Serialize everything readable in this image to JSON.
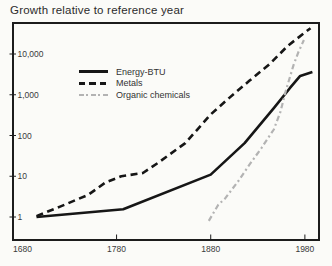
{
  "title": "Growth relative to reference year",
  "chart_data": {
    "type": "line",
    "title": "Growth relative to reference year",
    "xlabel": "",
    "ylabel": "",
    "x_scale": "linear",
    "y_scale": "log",
    "grid": false,
    "legend_position": "upper-left-inside",
    "x_ticks": [
      {
        "year": 1680,
        "label": "1680",
        "mark": false
      },
      {
        "year": 1780,
        "label": "1780",
        "mark": true
      },
      {
        "year": 1880,
        "label": "1880",
        "mark": true
      },
      {
        "year": 1980,
        "label": "1980",
        "mark": true
      }
    ],
    "y_ticks": [
      {
        "value": 1,
        "label": "1"
      },
      {
        "value": 10,
        "label": "10"
      },
      {
        "value": 100,
        "label": "100"
      },
      {
        "value": 1000,
        "label": "1,000"
      },
      {
        "value": 10000,
        "label": "10,000"
      }
    ],
    "series": [
      {
        "name": "Energy-BTU",
        "style": "solid",
        "color": "#161616",
        "width": 2.6,
        "points": [
          [
            1695,
            1
          ],
          [
            1787,
            1.55
          ],
          [
            1880,
            11
          ],
          [
            1916,
            65
          ],
          [
            1947,
            470
          ],
          [
            1964,
            1450
          ],
          [
            1975,
            2900
          ],
          [
            1988,
            3600
          ]
        ]
      },
      {
        "name": "Metals",
        "style": "dashed",
        "color": "#161616",
        "width": 2.6,
        "points": [
          [
            1695,
            1.05
          ],
          [
            1720,
            1.8
          ],
          [
            1750,
            3.5
          ],
          [
            1768,
            7
          ],
          [
            1785,
            10
          ],
          [
            1808,
            12
          ],
          [
            1825,
            22
          ],
          [
            1853,
            65
          ],
          [
            1880,
            330
          ],
          [
            1900,
            850
          ],
          [
            1921,
            2200
          ],
          [
            1942,
            5500
          ],
          [
            1962,
            16000
          ],
          [
            1986,
            43000
          ]
        ]
      },
      {
        "name": "Organic chemicals",
        "style": "dashdot",
        "color": "#b3b3b3",
        "width": 2.2,
        "points": [
          [
            1878,
            0.8
          ],
          [
            1888,
            2
          ],
          [
            1895,
            2.8
          ],
          [
            1910,
            8
          ],
          [
            1921,
            19
          ],
          [
            1934,
            50
          ],
          [
            1947,
            140
          ],
          [
            1954,
            380
          ],
          [
            1960,
            1300
          ],
          [
            1968,
            5400
          ],
          [
            1973,
            11000
          ],
          [
            1979,
            22000
          ]
        ]
      }
    ],
    "layout": {
      "plot_px": {
        "left": 13,
        "top": 23,
        "right": 319,
        "bottom": 240
      },
      "x_domain": [
        1670,
        1995
      ],
      "y1_px": 217,
      "y_decade_px": 40.75
    }
  }
}
